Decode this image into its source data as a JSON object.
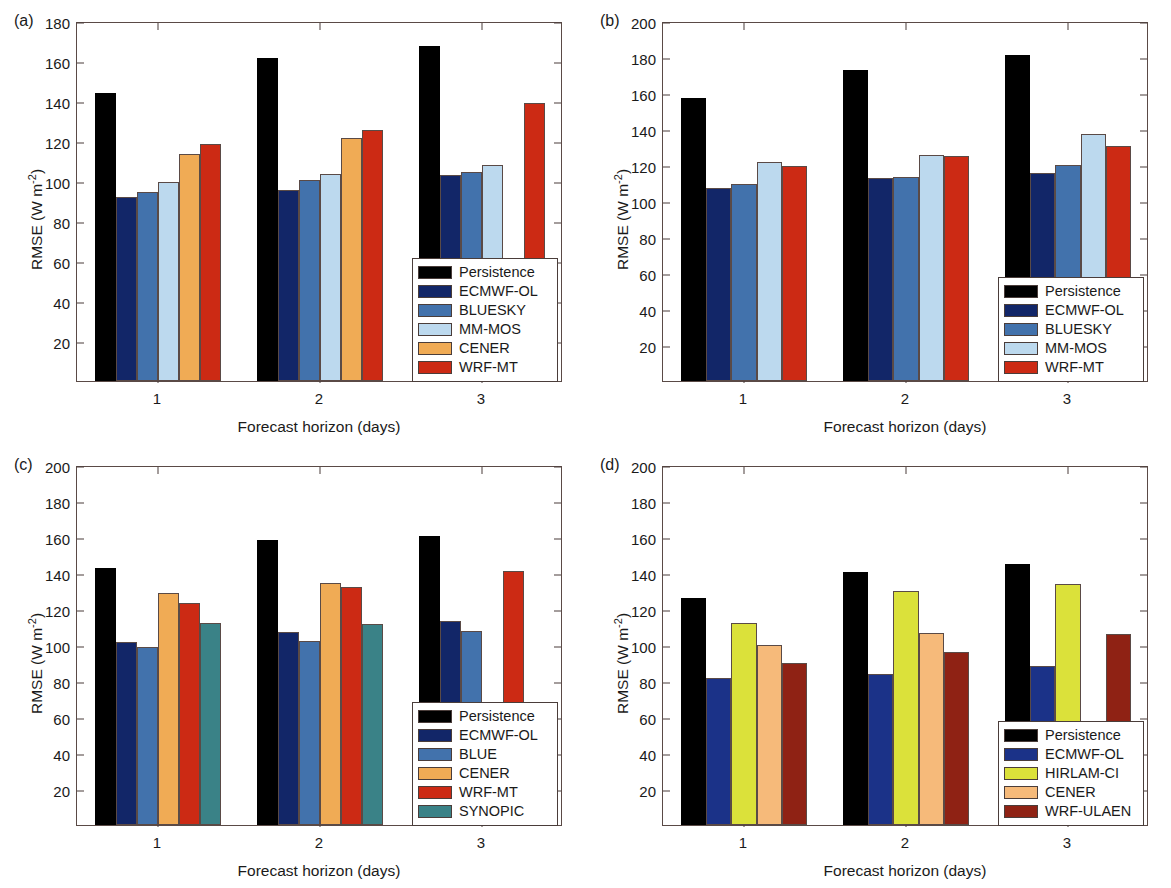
{
  "figure": {
    "xlabel": "Forecast horizon (days)",
    "ylabel_prefix": "RMSE (W m",
    "ylabel_sup": "-2",
    "ylabel_suffix": ")"
  },
  "chart_data": [
    {
      "type": "bar",
      "panel": "a",
      "panel_label": "(a)",
      "title": "",
      "xlabel": "Forecast horizon (days)",
      "ylabel": "RMSE (W m^-2)",
      "categories": [
        "1",
        "2",
        "3"
      ],
      "xtick_labels": [
        "1",
        "2",
        "3"
      ],
      "ylim": [
        0,
        180
      ],
      "yticks": [
        20,
        40,
        60,
        80,
        100,
        120,
        140,
        160,
        180
      ],
      "grid": false,
      "legend_position": "bottom-right",
      "series": [
        {
          "name": "Persistence",
          "color": "#000000",
          "values": [
            144.0,
            161.5,
            167.5
          ]
        },
        {
          "name": "ECMWF-OL",
          "color": "#122668",
          "values": [
            92.0,
            95.5,
            103.0
          ]
        },
        {
          "name": "BLUESKY",
          "color": "#4272ac",
          "values": [
            94.5,
            100.5,
            104.5
          ]
        },
        {
          "name": "MM-MOS",
          "color": "#bcd9ee",
          "values": [
            99.5,
            103.5,
            108.0
          ]
        },
        {
          "name": "CENER",
          "color": "#f0ab55",
          "values": [
            113.5,
            121.5,
            null
          ]
        },
        {
          "name": "WRF-MT",
          "color": "#cc2a14",
          "values": [
            118.5,
            125.5,
            139.0
          ]
        }
      ]
    },
    {
      "type": "bar",
      "panel": "b",
      "panel_label": "(b)",
      "title": "",
      "xlabel": "Forecast horizon (days)",
      "ylabel": "RMSE (W m^-2)",
      "categories": [
        "1",
        "2",
        "3"
      ],
      "xtick_labels": [
        "1",
        "2",
        "3"
      ],
      "ylim": [
        0,
        200
      ],
      "yticks": [
        20,
        40,
        60,
        80,
        100,
        120,
        140,
        160,
        180,
        200
      ],
      "grid": false,
      "legend_position": "bottom-right",
      "series": [
        {
          "name": "Persistence",
          "color": "#000000",
          "values": [
            157.5,
            173.0,
            181.0
          ]
        },
        {
          "name": "ECMWF-OL",
          "color": "#122668",
          "values": [
            107.0,
            113.0,
            115.5
          ]
        },
        {
          "name": "BLUESKY",
          "color": "#4272ac",
          "values": [
            109.5,
            113.5,
            120.0
          ]
        },
        {
          "name": "MM-MOS",
          "color": "#bcd9ee",
          "values": [
            121.5,
            125.5,
            137.0
          ]
        },
        {
          "name": "WRF-MT",
          "color": "#cc2a14",
          "values": [
            119.5,
            125.0,
            130.5
          ]
        }
      ]
    },
    {
      "type": "bar",
      "panel": "c",
      "panel_label": "(c)",
      "title": "",
      "xlabel": "Forecast horizon (days)",
      "ylabel": "RMSE (W m^-2)",
      "categories": [
        "1",
        "2",
        "3"
      ],
      "xtick_labels": [
        "1",
        "2",
        "3"
      ],
      "ylim": [
        0,
        200
      ],
      "yticks": [
        20,
        40,
        60,
        80,
        100,
        120,
        140,
        160,
        180,
        200
      ],
      "grid": false,
      "legend_position": "bottom-right",
      "series": [
        {
          "name": "Persistence",
          "color": "#000000",
          "values": [
            143.0,
            158.5,
            160.5
          ]
        },
        {
          "name": "ECMWF-OL",
          "color": "#122668",
          "values": [
            101.5,
            107.0,
            113.5
          ]
        },
        {
          "name": "BLUE",
          "color": "#4272ac",
          "values": [
            99.0,
            102.5,
            108.0
          ]
        },
        {
          "name": "CENER",
          "color": "#f0ab55",
          "values": [
            129.0,
            134.5,
            null
          ]
        },
        {
          "name": "WRF-MT",
          "color": "#cc2a14",
          "values": [
            123.5,
            132.5,
            141.0
          ]
        },
        {
          "name": "SYNOPIC",
          "color": "#3a8287",
          "values": [
            112.5,
            111.5,
            null
          ]
        }
      ]
    },
    {
      "type": "bar",
      "panel": "d",
      "panel_label": "(d)",
      "title": "",
      "xlabel": "Forecast horizon (days)",
      "ylabel": "RMSE (W m^-2)",
      "categories": [
        "1",
        "2",
        "3"
      ],
      "xtick_labels": [
        "1",
        "2",
        "3"
      ],
      "ylim": [
        0,
        200
      ],
      "yticks": [
        20,
        40,
        60,
        80,
        100,
        120,
        140,
        160,
        180,
        200
      ],
      "grid": false,
      "legend_position": "bottom-right",
      "series": [
        {
          "name": "Persistence",
          "color": "#000000",
          "values": [
            126.0,
            140.5,
            145.0
          ]
        },
        {
          "name": "ECMWF-OL",
          "color": "#1b3288",
          "values": [
            81.5,
            84.0,
            88.5
          ]
        },
        {
          "name": "HIRLAM-CI",
          "color": "#dbe13a",
          "values": [
            112.5,
            130.0,
            134.0
          ]
        },
        {
          "name": "CENER",
          "color": "#f6ba7a",
          "values": [
            100.0,
            106.5,
            null
          ]
        },
        {
          "name": "WRF-ULAEN",
          "color": "#8f2214",
          "values": [
            90.0,
            96.0,
            106.0
          ]
        }
      ]
    }
  ]
}
